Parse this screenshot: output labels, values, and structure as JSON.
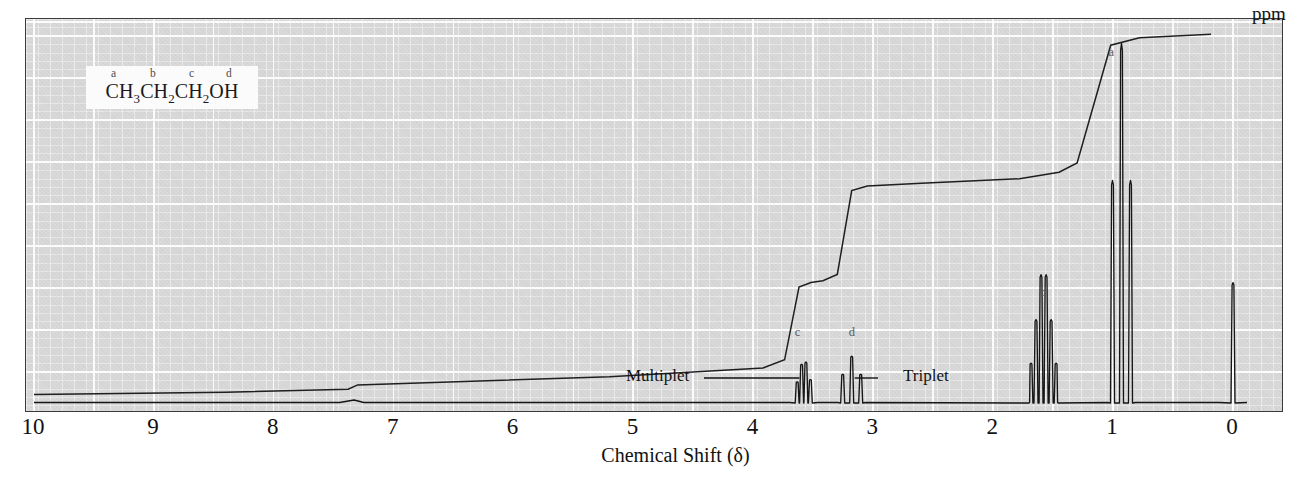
{
  "figure": {
    "kind": "nmr-spectrum",
    "axis_title": "Chemical Shift (δ)",
    "unit_label": "ppm",
    "molecule": {
      "formula_parts": [
        "CH",
        "3",
        "CH",
        "2",
        "CH",
        "2",
        "OH"
      ],
      "formula_plain": "CH3CH2CH2OH",
      "assignment_letters": [
        "a",
        "b",
        "c",
        "d"
      ]
    },
    "annotations": [
      {
        "label": "Multiplet",
        "points_to": "c"
      },
      {
        "label": "Triplet",
        "points_to": "d"
      }
    ],
    "peak_labels": [
      "a",
      "b",
      "c",
      "d"
    ],
    "colors": {
      "plot_background": "#d8d8d8",
      "gridline": "#ffffff",
      "frame": "#3a3a3a",
      "trace": "#1a1a1a",
      "integral": "#1f1f1f",
      "label_text": "#5a5a5a",
      "annotation_text": "#121212"
    }
  },
  "chart_data": {
    "type": "line",
    "title": "",
    "xlabel": "Chemical Shift (δ)",
    "ylabel": "",
    "xlim": [
      10,
      0
    ],
    "x_unit": "ppm",
    "x_ticks": [
      10,
      9,
      8,
      7,
      6,
      5,
      4,
      3,
      2,
      1,
      0
    ],
    "x_tick_labels": [
      "10",
      "9",
      "8",
      "7",
      "6",
      "5",
      "4",
      "3",
      "2",
      "1",
      "0"
    ],
    "grid": true,
    "legend": "none",
    "series": [
      {
        "name": "1H NMR spectrum of 1-propanol",
        "type": "line",
        "peaks": [
          {
            "id": "c",
            "label": "c",
            "shift_ppm": 3.58,
            "multiplicity": "multiplet",
            "protons": 2,
            "relative_height": 0.12,
            "assignment": "CH2-O"
          },
          {
            "id": "d",
            "label": "d",
            "shift_ppm": 3.18,
            "multiplicity": "triplet",
            "protons": 1,
            "relative_height": 0.13,
            "assignment": "OH"
          },
          {
            "id": "b",
            "label": "b",
            "shift_ppm": 1.58,
            "multiplicity": "sextet",
            "protons": 2,
            "relative_height": 0.37,
            "assignment": "CH2"
          },
          {
            "id": "a",
            "label": "a",
            "shift_ppm": 0.93,
            "multiplicity": "triplet",
            "protons": 3,
            "relative_height": 0.98,
            "assignment": "CH3"
          },
          {
            "id": "tms",
            "label": "",
            "shift_ppm": 0.0,
            "multiplicity": "singlet",
            "protons": 0,
            "relative_height": 0.33,
            "assignment": "TMS reference"
          }
        ]
      },
      {
        "name": "Integral trace",
        "type": "step",
        "steps": [
          {
            "shift_ppm": 3.58,
            "cumulative": 0.18,
            "label": "c"
          },
          {
            "shift_ppm": 3.18,
            "cumulative": 0.31,
            "label": "d"
          },
          {
            "shift_ppm": 1.58,
            "cumulative": 0.6,
            "label": "b"
          },
          {
            "shift_ppm": 0.93,
            "cumulative": 0.95,
            "label": "a"
          }
        ]
      }
    ]
  }
}
